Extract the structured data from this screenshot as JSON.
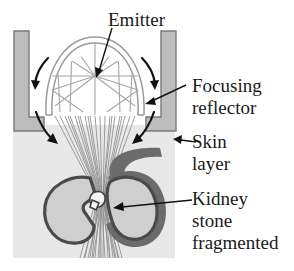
{
  "figure": {
    "labels": {
      "emitter": "Emitter",
      "focusing_reflector_line1": "Focusing",
      "focusing_reflector_line2": "reflector",
      "skin_line1": "Skin",
      "skin_line2": "layer",
      "kidney_line1": "Kidney",
      "kidney_line2": "stone",
      "kidney_line3": "fragmented"
    },
    "colors": {
      "background": "#ffffff",
      "housing_fill": "#bdbdbd",
      "housing_stroke": "#7a7a7a",
      "skin_fill": "#e8e8e8",
      "kidney_fill": "#cfcfcf",
      "kidney_outline": "#4a4a4a",
      "ureter_fill": "#6b6b6b",
      "ray_stroke": "#8c8c8c",
      "reflector_stroke": "#9a9a9a",
      "text": "#1a1a1a",
      "leader": "#111111"
    },
    "parts": {
      "emitter_focus": "emitter-focal-point",
      "stone_focus": "stone-focal-point",
      "reflector_shape": "semi-ellipsoid-dome",
      "housing_left": "left-l-bracket",
      "housing_right": "right-l-bracket",
      "ray_count": 22
    }
  }
}
